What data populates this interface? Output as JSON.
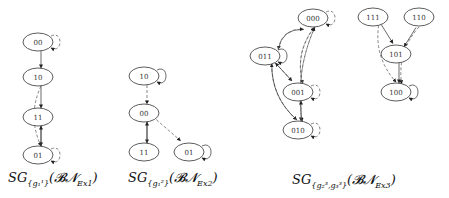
{
  "figures": [
    {
      "caption": {
        "prefix": "SG",
        "subscript": "{g₁¹}",
        "paren": "(𝓑𝓝",
        "net_sub": "Ex1",
        "close": ")"
      },
      "nodes": [
        {
          "id": "00",
          "x": 38,
          "y": 42
        },
        {
          "id": "10",
          "x": 38,
          "y": 77
        },
        {
          "id": "11",
          "x": 38,
          "y": 117
        },
        {
          "id": "01",
          "x": 38,
          "y": 155
        }
      ],
      "edges": [
        {
          "from": "00",
          "to": "00",
          "style": "dashed",
          "self": true
        },
        {
          "from": "00",
          "to": "10",
          "style": "solid"
        },
        {
          "from": "10",
          "to": "11",
          "style": "solid"
        },
        {
          "from": "10",
          "to": "01",
          "style": "dashed"
        },
        {
          "from": "11",
          "to": "01",
          "style": "solid"
        },
        {
          "from": "01",
          "to": "11",
          "style": "solid"
        },
        {
          "from": "01",
          "to": "01",
          "style": "dashed",
          "self": true
        }
      ]
    },
    {
      "caption": {
        "prefix": "SG",
        "subscript": "{g₁²}",
        "paren": "(𝓑𝓝",
        "net_sub": "Ex2",
        "close": ")"
      },
      "nodes": [
        {
          "id": "10",
          "x": 144,
          "y": 76
        },
        {
          "id": "00",
          "x": 144,
          "y": 113
        },
        {
          "id": "11",
          "x": 144,
          "y": 152
        },
        {
          "id": "01",
          "x": 189,
          "y": 152
        }
      ],
      "edges": [
        {
          "from": "10",
          "to": "10",
          "style": "solid",
          "self": true
        },
        {
          "from": "10",
          "to": "00",
          "style": "dashed"
        },
        {
          "from": "00",
          "to": "11",
          "style": "solid"
        },
        {
          "from": "11",
          "to": "00",
          "style": "solid"
        },
        {
          "from": "00",
          "to": "01",
          "style": "dashed"
        },
        {
          "from": "01",
          "to": "01",
          "style": "solid",
          "self": true
        }
      ]
    },
    {
      "caption": {
        "prefix": "SG",
        "subscript": "{g₂³,g₃³}",
        "paren": "(𝓑𝓝",
        "net_sub": "Ex3",
        "close": ")"
      },
      "nodes": [
        {
          "id": "000",
          "x": 313,
          "y": 18
        },
        {
          "id": "011",
          "x": 265,
          "y": 56
        },
        {
          "id": "001",
          "x": 298,
          "y": 92
        },
        {
          "id": "010",
          "x": 298,
          "y": 130
        },
        {
          "id": "111",
          "x": 373,
          "y": 17
        },
        {
          "id": "110",
          "x": 419,
          "y": 17
        },
        {
          "id": "101",
          "x": 396,
          "y": 54
        },
        {
          "id": "100",
          "x": 396,
          "y": 92
        }
      ],
      "edges": [
        {
          "from": "000",
          "to": "000",
          "style": "dashed",
          "self": true
        },
        {
          "from": "000",
          "to": "011",
          "style": "solid"
        },
        {
          "from": "011",
          "to": "000",
          "style": "dashed"
        },
        {
          "from": "011",
          "to": "011",
          "style": "solid",
          "self": true
        },
        {
          "from": "011",
          "to": "001",
          "style": "dashed"
        },
        {
          "from": "001",
          "to": "011",
          "style": "solid"
        },
        {
          "from": "011",
          "to": "010",
          "style": "dashed"
        },
        {
          "from": "010",
          "to": "011",
          "style": "solid"
        },
        {
          "from": "000",
          "to": "001",
          "style": "dashed"
        },
        {
          "from": "001",
          "to": "000",
          "style": "dashed"
        },
        {
          "from": "000",
          "to": "010",
          "style": "dashed"
        },
        {
          "from": "010",
          "to": "000",
          "style": "dashed"
        },
        {
          "from": "001",
          "to": "001",
          "style": "dashed",
          "self": true
        },
        {
          "from": "001",
          "to": "010",
          "style": "dashed"
        },
        {
          "from": "010",
          "to": "001",
          "style": "dashed"
        },
        {
          "from": "010",
          "to": "010",
          "style": "dashed",
          "self": true
        },
        {
          "from": "111",
          "to": "101",
          "style": "solid"
        },
        {
          "from": "110",
          "to": "101",
          "style": "solid"
        },
        {
          "from": "111",
          "to": "100",
          "style": "dashed"
        },
        {
          "from": "110",
          "to": "100",
          "style": "dashed"
        },
        {
          "from": "101",
          "to": "100",
          "style": "solid"
        },
        {
          "from": "100",
          "to": "100",
          "style": "solid",
          "self": true
        }
      ]
    }
  ]
}
